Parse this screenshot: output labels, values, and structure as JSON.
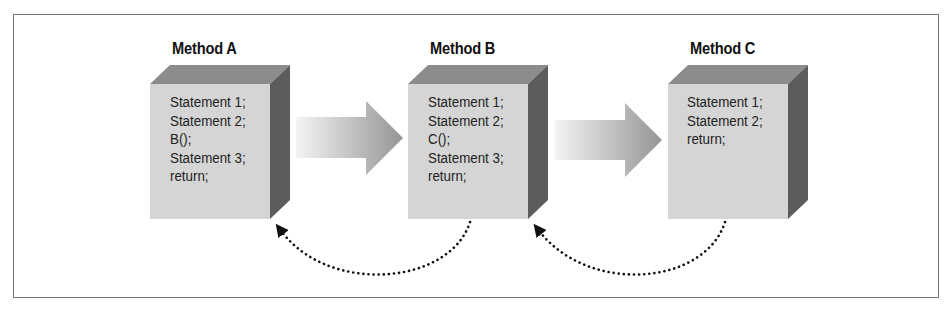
{
  "diagram": {
    "methods": [
      {
        "title": "Method A",
        "statements": [
          "Statement 1;",
          "Statement 2;",
          "B();",
          "Statement 3;",
          "return;"
        ]
      },
      {
        "title": "Method B",
        "statements": [
          "Statement 1;",
          "Statement 2;",
          "C();",
          "Statement 3;",
          "return;"
        ]
      },
      {
        "title": "Method C",
        "statements": [
          "Statement 1;",
          "Statement 2;",
          "return;"
        ]
      }
    ],
    "calls": [
      {
        "from": "Method A",
        "to": "Method B",
        "style": "solid-gradient-arrow"
      },
      {
        "from": "Method B",
        "to": "Method C",
        "style": "solid-gradient-arrow"
      }
    ],
    "returns": [
      {
        "from": "Method B",
        "to": "Method A",
        "style": "dotted-curved-arrow"
      },
      {
        "from": "Method C",
        "to": "Method B",
        "style": "dotted-curved-arrow"
      }
    ],
    "colors": {
      "front_face": "#d4d4d4",
      "top_face": "#8a8a8a",
      "side_face": "#5a5a5a",
      "arrow_light": "#f2f2f2",
      "arrow_dark": "#9a9a9a",
      "return_arrow": "#111111"
    }
  }
}
